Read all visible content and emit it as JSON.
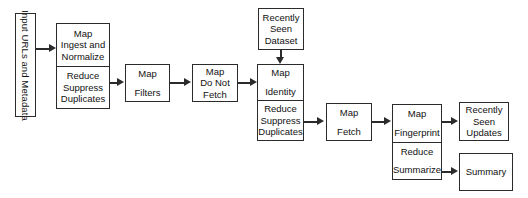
{
  "diagram": {
    "colors": {
      "stroke": "#2b2b2b",
      "fill": "#ffffff",
      "text": "#111111"
    },
    "input_label": {
      "text": "Input URLs and Metadata"
    },
    "nodes": [
      {
        "id": "ingest",
        "cells": [
          {
            "lines": [
              "Map",
              "Ingest and",
              "Normalize"
            ]
          },
          {
            "lines": [
              "Reduce",
              "Suppress",
              "Duplicates"
            ]
          }
        ]
      },
      {
        "id": "filters",
        "cells": [
          {
            "lines": [
              "Map",
              "",
              "Filters"
            ]
          }
        ]
      },
      {
        "id": "do-not-fetch",
        "cells": [
          {
            "lines": [
              "Map",
              "Do Not",
              "Fetch"
            ]
          }
        ]
      },
      {
        "id": "recently-seen-dataset",
        "cells": [
          {
            "lines": [
              "Recently",
              "Seen",
              "Dataset"
            ]
          }
        ]
      },
      {
        "id": "identity",
        "cells": [
          {
            "lines": [
              "Map",
              "",
              "Identity"
            ]
          },
          {
            "lines": [
              "Reduce",
              "Suppress",
              "Duplicates"
            ]
          }
        ]
      },
      {
        "id": "fetch",
        "cells": [
          {
            "lines": [
              "Map",
              "",
              "Fetch"
            ]
          }
        ]
      },
      {
        "id": "fingerprint",
        "cells": [
          {
            "lines": [
              "Map",
              "",
              "Fingerprint"
            ]
          },
          {
            "lines": [
              "Reduce",
              "",
              "Summarize"
            ]
          }
        ]
      },
      {
        "id": "recently-seen-updates",
        "cells": [
          {
            "lines": [
              "Recently",
              "Seen",
              "Updates"
            ]
          }
        ]
      },
      {
        "id": "summary",
        "cells": [
          {
            "lines": [
              "Summary"
            ]
          }
        ]
      }
    ],
    "labels": {
      "ingest_map": "Map",
      "ingest_map_l2": "Ingest and",
      "ingest_map_l3": "Normalize",
      "ingest_reduce": "Reduce",
      "ingest_reduce_l2": "Suppress",
      "ingest_reduce_l3": "Duplicates",
      "filters_map": "Map",
      "filters_name": "Filters",
      "dnf_map": "Map",
      "dnf_l2": "Do Not",
      "dnf_l3": "Fetch",
      "rsd_l1": "Recently",
      "rsd_l2": "Seen",
      "rsd_l3": "Dataset",
      "identity_map": "Map",
      "identity_name": "Identity",
      "identity_reduce": "Reduce",
      "identity_reduce_l2": "Suppress",
      "identity_reduce_l3": "Duplicates",
      "fetch_map": "Map",
      "fetch_name": "Fetch",
      "fp_map": "Map",
      "fp_name": "Fingerprint",
      "fp_reduce": "Reduce",
      "fp_reduce_name": "Summarize",
      "rsu_l1": "Recently",
      "rsu_l2": "Seen",
      "rsu_l3": "Updates",
      "summary_name": "Summary",
      "input_text": "Input URLs and Metadata"
    }
  }
}
